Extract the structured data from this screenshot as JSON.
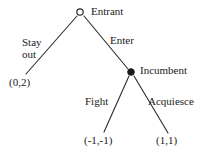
{
  "diagram": {
    "type": "extensive-form-game-tree",
    "background_color": "#ffffff",
    "line_color": "#2b2b2b",
    "text_color": "#1a1a1a"
  },
  "nodes": [
    {
      "id": "root",
      "player": "Entrant",
      "label": "Entrant",
      "marker": "hollow-circle",
      "x": 80,
      "y": 12
    },
    {
      "id": "incumbent",
      "player": "Incumbent",
      "label": "Incumbent",
      "marker": "filled-circle",
      "x": 131,
      "y": 72
    }
  ],
  "edges": [
    {
      "id": "stay-out",
      "from": "root",
      "to": "terminal-stay-out",
      "label_line1": "Stay",
      "label_line2": "out"
    },
    {
      "id": "enter",
      "from": "root",
      "to": "incumbent",
      "label": "Enter"
    },
    {
      "id": "fight",
      "from": "incumbent",
      "to": "terminal-fight",
      "label": "Fight"
    },
    {
      "id": "acquiesce",
      "from": "incumbent",
      "to": "terminal-acquiesce",
      "label": "Acquiesce"
    }
  ],
  "terminals": [
    {
      "id": "terminal-stay-out",
      "payoff": "(0,2)",
      "entrant_payoff": 0,
      "incumbent_payoff": 2,
      "x": 26,
      "y": 74
    },
    {
      "id": "terminal-fight",
      "payoff": "(-1,-1)",
      "entrant_payoff": -1,
      "incumbent_payoff": -1,
      "x": 104,
      "y": 132
    },
    {
      "id": "terminal-acquiesce",
      "payoff": "(1,1)",
      "entrant_payoff": 1,
      "incumbent_payoff": 1,
      "x": 168,
      "y": 133
    }
  ]
}
